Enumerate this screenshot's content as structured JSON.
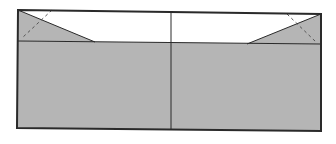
{
  "diagram": {
    "type": "cross-section",
    "colors": {
      "fill": "#b5b5b5",
      "stroke": "#2a2a2a",
      "background": "#ffffff",
      "dash": "#555555"
    },
    "frame": {
      "points": "18,10 321,14 321,131 17,128"
    },
    "lower_region": {
      "points": "18,41 171,42.5 321,44 321,131 17,128"
    },
    "left_wedge": {
      "points": "18,10 95,42 18,41"
    },
    "right_wedge": {
      "points": "321,14 247,44 321,44"
    },
    "horizontal_line": {
      "x1": 18,
      "y1": 41,
      "x2": 321,
      "y2": 44
    },
    "center_line": {
      "x1": 171,
      "y1": 12,
      "x2": 171,
      "y2": 130
    },
    "left_dashed": {
      "x1": 52,
      "y1": 10,
      "x2": 22,
      "y2": 38
    },
    "right_dashed": {
      "x1": 287,
      "y1": 14,
      "x2": 316,
      "y2": 42
    }
  }
}
